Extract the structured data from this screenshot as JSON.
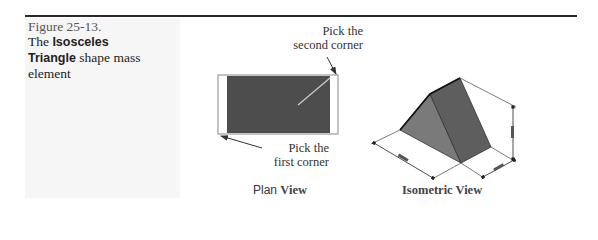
{
  "caption": {
    "figure_number": "Figure 25-13.",
    "text_pre": "The ",
    "bold_1": "Isosceles",
    "bold_2": "Triangle",
    "text_post": " shape mass element"
  },
  "plan_view": {
    "callout_second_line1": "Pick the",
    "callout_second_line2": "second corner",
    "callout_first_line1": "Pick the",
    "callout_first_line2": "first corner",
    "label_part1": "Plan ",
    "label_part2": "View"
  },
  "isometric_view": {
    "label": "Isometric View",
    "dimension_labels": [
      "width",
      "depth",
      "height"
    ]
  },
  "colors": {
    "rule": "#2a2a2a",
    "plan_fill": "#4d4d4d",
    "iso_left_face": "#7a7a7a",
    "iso_right_face": "#5e5e5e",
    "panel_bg": "#f6f6f6"
  }
}
